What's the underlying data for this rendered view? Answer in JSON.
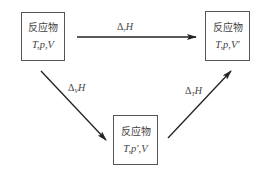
{
  "diagram": {
    "title": "",
    "nodes": [
      {
        "id": "initial",
        "name": "反应物",
        "vars": "T,p,V"
      },
      {
        "id": "final",
        "name": "反应物",
        "vars": "T,p,V′"
      },
      {
        "id": "intermediate",
        "name": "反应物",
        "vars": "T,p′,V"
      }
    ],
    "edges": [
      {
        "id": "direct",
        "from": "initial",
        "to": "final",
        "symbol": "Δ",
        "subscript": "r",
        "quantity": "H"
      },
      {
        "id": "step1",
        "from": "initial",
        "to": "intermediate",
        "symbol": "Δ",
        "subscript": "V",
        "quantity": "H"
      },
      {
        "id": "step2",
        "from": "intermediate",
        "to": "final",
        "symbol": "Δ",
        "subscript": "T",
        "quantity": "H"
      }
    ],
    "colors": {
      "line": "#222222",
      "box_border": "#555555",
      "text": "#444444"
    }
  }
}
